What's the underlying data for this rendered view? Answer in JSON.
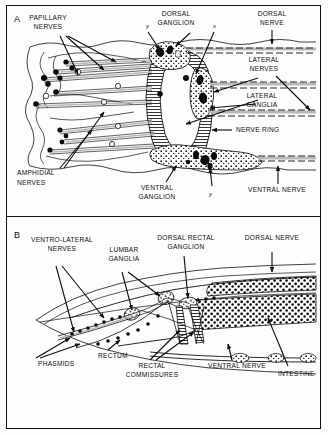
{
  "figure": {
    "type": "anatomical-diagram",
    "panels": [
      {
        "id": "A",
        "label": "A",
        "title": "Anterior nervous system — nerve ring region",
        "annotations": [
          {
            "name": "papillary-nerves",
            "text": "PAPILLARY\nNERVES",
            "x": 48,
            "y": 20
          },
          {
            "name": "dorsal-ganglion",
            "text": "DORSAL\nGANGLION",
            "x": 172,
            "y": 16
          },
          {
            "name": "dorsal-nerve",
            "text": "DORSAL\nNERVE",
            "x": 268,
            "y": 16
          },
          {
            "name": "lateral-nerves",
            "text": "LATERAL\nNERVES",
            "x": 262,
            "y": 62
          },
          {
            "name": "lateral-ganglia",
            "text": "LATERAL\nGANGLIA",
            "x": 262,
            "y": 96
          },
          {
            "name": "nerve-ring",
            "text": "NERVE  RING",
            "x": 233,
            "y": 130
          },
          {
            "name": "amphidial-nerves",
            "text": "AMPHIDIAL\nNERVES",
            "x": 17,
            "y": 173
          },
          {
            "name": "ventral-ganglion",
            "text": "VENTRAL\nGANGLION",
            "x": 152,
            "y": 186
          },
          {
            "name": "ventral-nerve",
            "text": "VENTRAL  NERVE",
            "x": 244,
            "y": 188
          }
        ],
        "markers": [
          {
            "name": "marker-y-dorsal",
            "text": "y",
            "x": 147,
            "y": 26
          },
          {
            "name": "marker-x-dorsal",
            "text": "x",
            "x": 214,
            "y": 26
          },
          {
            "name": "marker-y-ventral",
            "text": "y",
            "x": 210,
            "y": 192
          }
        ]
      },
      {
        "id": "B",
        "label": "B",
        "title": "Posterior nervous system — rectal / lumbar region",
        "annotations": [
          {
            "name": "ventro-lateral-nerves",
            "text": "VENTRO-LATERAL\nNERVES",
            "x": 30,
            "y": 252
          },
          {
            "name": "lumbar-ganglia",
            "text": "LUMBAR\nGANGLIA",
            "x": 104,
            "y": 258
          },
          {
            "name": "dorsal-rectal-ganglion",
            "text": "DORSAL RECTAL\nGANGLION",
            "x": 163,
            "y": 240
          },
          {
            "name": "dorsal-nerve-b",
            "text": "DORSAL  NERVE",
            "x": 245,
            "y": 240
          },
          {
            "name": "phasmids",
            "text": "PHASMIDS",
            "x": 28,
            "y": 363
          },
          {
            "name": "rectum",
            "text": "RECTUM",
            "x": 96,
            "y": 355
          },
          {
            "name": "rectal-commissures",
            "text": "RECTAL\nCOMMISSURES",
            "x": 124,
            "y": 364
          },
          {
            "name": "ventral-nerve-b",
            "text": "VENTRAL  NERVE",
            "x": 206,
            "y": 364
          },
          {
            "name": "intestine",
            "text": "INTESTINE",
            "x": 277,
            "y": 372
          }
        ],
        "markers": []
      }
    ],
    "colors": {
      "ink": "#0d0d0d",
      "paper": "#ffffff",
      "nerve_band": "#b9b9b9",
      "frame": "#111111"
    }
  }
}
